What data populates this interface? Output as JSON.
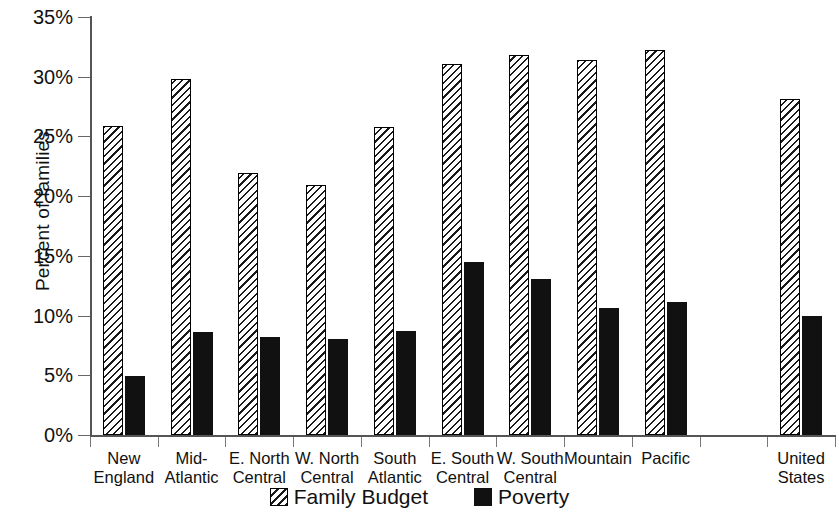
{
  "chart_data": {
    "type": "bar",
    "title": "",
    "xlabel": "",
    "ylabel": "Percent of families",
    "ylim": [
      0,
      35
    ],
    "ytick_labels": [
      "0%",
      "5%",
      "10%",
      "15%",
      "20%",
      "25%",
      "30%",
      "35%"
    ],
    "ytick_values": [
      0,
      5,
      10,
      15,
      20,
      25,
      30,
      35
    ],
    "grid": false,
    "legend_position": "bottom-center",
    "categories": [
      "New England",
      "Mid-Atlantic",
      "E. North Central",
      "W. North Central",
      "South Atlantic",
      "E. South Central",
      "W. South Central",
      "Mountain",
      "Pacific",
      "United States"
    ],
    "category_lines": [
      [
        "New",
        "England"
      ],
      [
        "Mid-",
        "Atlantic"
      ],
      [
        "E. North",
        "Central"
      ],
      [
        "W. North",
        "Central"
      ],
      [
        "South",
        "Atlantic"
      ],
      [
        "E. South",
        "Central"
      ],
      [
        "W. South",
        "Central"
      ],
      [
        "Mountain",
        ""
      ],
      [
        "Pacific",
        ""
      ],
      [
        "United",
        "States"
      ]
    ],
    "series": [
      {
        "name": "Family Budget",
        "pattern": "diagonal-hatch",
        "values": [
          25.9,
          29.8,
          21.9,
          20.9,
          25.8,
          31.1,
          31.8,
          31.4,
          32.2,
          28.1
        ]
      },
      {
        "name": "Poverty",
        "pattern": "solid",
        "color": "#111111",
        "values": [
          4.9,
          8.6,
          8.2,
          8.0,
          8.7,
          14.5,
          13.1,
          10.6,
          11.1,
          10.0
        ]
      }
    ]
  },
  "legend": {
    "items": [
      {
        "label": "Family Budget",
        "swatch": "hatched-square-icon"
      },
      {
        "label": "Poverty",
        "swatch": "filled-square-icon"
      }
    ]
  },
  "axis": {
    "y_title": "Percent of families"
  }
}
